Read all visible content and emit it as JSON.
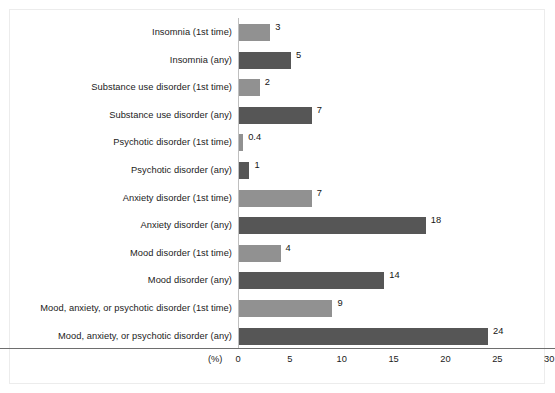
{
  "chart_data": {
    "type": "bar",
    "orientation": "horizontal",
    "title": "",
    "xlabel": "(%)",
    "ylabel": "",
    "xlim": [
      0,
      30
    ],
    "xticks": [
      0,
      5,
      10,
      15,
      20,
      25,
      30
    ],
    "xtick_labels": [
      "0",
      "5",
      "10",
      "15",
      "20",
      "25",
      "30"
    ],
    "grid": false,
    "legend": null,
    "unit_label": "(%)",
    "categories": [
      "Insomnia (1st time)",
      "Insomnia (any)",
      "Substance use disorder (1st time)",
      "Substance use disorder (any)",
      "Psychotic disorder (1st time)",
      "Psychotic disorder (any)",
      "Anxiety disorder (1st time)",
      "Anxiety disorder (any)",
      "Mood disorder (1st time)",
      "Mood disorder (any)",
      "Mood, anxiety, or psychotic disorder (1st time)",
      "Mood, anxiety, or psychotic disorder (any)"
    ],
    "values": [
      3,
      5,
      2,
      7,
      0.4,
      1,
      7,
      18,
      4,
      14,
      9,
      24
    ],
    "value_labels": [
      "3",
      "5",
      "2",
      "7",
      "0.4",
      "1",
      "7",
      "18",
      "4",
      "14",
      "9",
      "24"
    ],
    "series_kinds": [
      "first-time",
      "any",
      "first-time",
      "any",
      "first-time",
      "any",
      "first-time",
      "any",
      "first-time",
      "any",
      "first-time",
      "any"
    ],
    "colors": {
      "first_time_bar": "#919191",
      "any_bar": "#565656",
      "axis": "#6e6e6e",
      "text": "#1b1b1b",
      "background": "#ffffff",
      "frame": "#ececec"
    }
  },
  "bars": [
    {
      "label": "Insomnia (1st time)",
      "value": 3,
      "value_label": "3",
      "kind": "first-time"
    },
    {
      "label": "Insomnia (any)",
      "value": 5,
      "value_label": "5",
      "kind": "any"
    },
    {
      "label": "Substance use disorder (1st time)",
      "value": 2,
      "value_label": "2",
      "kind": "first-time"
    },
    {
      "label": "Substance use disorder (any)",
      "value": 7,
      "value_label": "7",
      "kind": "any"
    },
    {
      "label": "Psychotic disorder (1st time)",
      "value": 0.4,
      "value_label": "0.4",
      "kind": "first-time"
    },
    {
      "label": "Psychotic disorder (any)",
      "value": 1,
      "value_label": "1",
      "kind": "any"
    },
    {
      "label": "Anxiety disorder (1st time)",
      "value": 7,
      "value_label": "7",
      "kind": "first-time"
    },
    {
      "label": "Anxiety disorder (any)",
      "value": 18,
      "value_label": "18",
      "kind": "any"
    },
    {
      "label": "Mood disorder (1st time)",
      "value": 4,
      "value_label": "4",
      "kind": "first-time"
    },
    {
      "label": "Mood disorder (any)",
      "value": 14,
      "value_label": "14",
      "kind": "any"
    },
    {
      "label": "Mood, anxiety, or psychotic disorder (1st time)",
      "value": 9,
      "value_label": "9",
      "kind": "first-time"
    },
    {
      "label": "Mood, anxiety, or psychotic disorder (any)",
      "value": 24,
      "value_label": "24",
      "kind": "any"
    }
  ],
  "axis": {
    "unit_label": "(%)",
    "ticks": [
      "0",
      "5",
      "10",
      "15",
      "20",
      "25",
      "30"
    ]
  }
}
